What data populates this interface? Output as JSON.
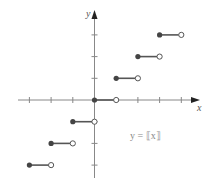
{
  "chart_data": {
    "type": "line",
    "title": "",
    "function_label": "y = ⟦x⟧",
    "xlabel": "x",
    "ylabel": "y",
    "xlim": [
      -3,
      4
    ],
    "ylim": [
      -3,
      3
    ],
    "grid": false,
    "axis_ticks": {
      "x": [
        -3,
        -2,
        -1,
        1,
        2,
        3,
        4
      ],
      "y": [
        -3,
        -2,
        -1,
        1,
        2,
        3
      ]
    },
    "segments": [
      {
        "x_start": -3,
        "x_end": -2,
        "y": -3,
        "closed_left": true,
        "open_right": true
      },
      {
        "x_start": -2,
        "x_end": -1,
        "y": -2,
        "closed_left": true,
        "open_right": true
      },
      {
        "x_start": -1,
        "x_end": 0,
        "y": -1,
        "closed_left": true,
        "open_right": true
      },
      {
        "x_start": 0,
        "x_end": 1,
        "y": 0,
        "closed_left": true,
        "open_right": true
      },
      {
        "x_start": 1,
        "x_end": 2,
        "y": 1,
        "closed_left": true,
        "open_right": true
      },
      {
        "x_start": 2,
        "x_end": 3,
        "y": 2,
        "closed_left": true,
        "open_right": true
      },
      {
        "x_start": 3,
        "x_end": 4,
        "y": 3,
        "closed_left": true,
        "open_right": true
      }
    ]
  },
  "colors": {
    "axis": "#888888",
    "segment": "#555555",
    "filled_dot": "#444444",
    "open_dot_fill": "#ffffff",
    "label": "#888888"
  }
}
